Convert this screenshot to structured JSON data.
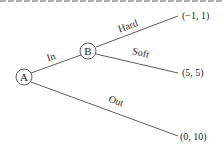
{
  "nodes": [
    {
      "id": "A",
      "label": "A"
    },
    {
      "id": "B",
      "label": "B"
    }
  ],
  "edges": [
    {
      "from": "A",
      "to": "B",
      "label": "In"
    },
    {
      "from": "B",
      "to": "hard_payoff",
      "label": "Hard"
    },
    {
      "from": "B",
      "to": "soft_payoff",
      "label": "Soft"
    },
    {
      "from": "A",
      "to": "out_payoff",
      "label": "Out"
    }
  ],
  "payoffs": {
    "hard": "(−1, 1)",
    "soft": "(5, 5)",
    "out": "(0, 10)"
  },
  "colors": {
    "line": "#333333",
    "text": "#222222",
    "border": "#888888"
  }
}
